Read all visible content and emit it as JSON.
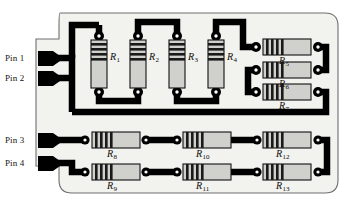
{
  "figure": {
    "background_color": "#ffffff",
    "board_fill": "#f2f2ee",
    "board_outline_color": "#6e6e6e",
    "trace_color": "#000000",
    "resistor_body_color": "#d0d0cc",
    "resistor_band_color": "#1a1a1a",
    "resistor_outline_color": "#111111",
    "pad_color": "#000000",
    "pad_hole_color": "#ffffff"
  },
  "pins": [
    {
      "id": "pin-1",
      "label": "Pin 1"
    },
    {
      "id": "pin-2",
      "label": "Pin 2"
    },
    {
      "id": "pin-3",
      "label": "Pin 3"
    },
    {
      "id": "pin-4",
      "label": "Pin 4"
    }
  ],
  "resistors": [
    {
      "id": "R1",
      "name": "R",
      "index": "1",
      "orientation": "vertical"
    },
    {
      "id": "R2",
      "name": "R",
      "index": "2",
      "orientation": "vertical"
    },
    {
      "id": "R3",
      "name": "R",
      "index": "3",
      "orientation": "vertical"
    },
    {
      "id": "R4",
      "name": "R",
      "index": "4",
      "orientation": "vertical"
    },
    {
      "id": "R5",
      "name": "R",
      "index": "5",
      "orientation": "horizontal"
    },
    {
      "id": "R6",
      "name": "R",
      "index": "6",
      "orientation": "horizontal"
    },
    {
      "id": "R7",
      "name": "R",
      "index": "7",
      "orientation": "horizontal"
    },
    {
      "id": "R8",
      "name": "R",
      "index": "8",
      "orientation": "horizontal"
    },
    {
      "id": "R9",
      "name": "R",
      "index": "9",
      "orientation": "horizontal"
    },
    {
      "id": "R10",
      "name": "R",
      "index": "10",
      "orientation": "horizontal"
    },
    {
      "id": "R11",
      "name": "R",
      "index": "11",
      "orientation": "horizontal"
    },
    {
      "id": "R12",
      "name": "R",
      "index": "12",
      "orientation": "horizontal"
    },
    {
      "id": "R13",
      "name": "R",
      "index": "13",
      "orientation": "horizontal"
    }
  ]
}
